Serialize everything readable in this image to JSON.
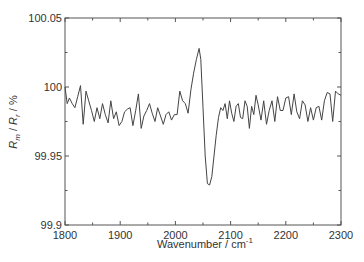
{
  "chart_data": {
    "type": "line",
    "title": "",
    "xlabel": "Wavenumber / cm-1",
    "xlabel_main": "Wavenumber / cm",
    "xlabel_sup": "-1",
    "ylabel": "R_m / R_r / %",
    "ylabel_parts": {
      "r1": "R",
      "sub1": "m",
      "sep1": " / ",
      "r2": "R",
      "sub2": "r",
      "sep2": " / %"
    },
    "xlim": [
      1800,
      2300
    ],
    "ylim": [
      99.9,
      100.05
    ],
    "x_ticks": [
      1800,
      1900,
      2000,
      2100,
      2200,
      2300
    ],
    "x_tick_labels": [
      "1800",
      "1900",
      "2000",
      "2100",
      "2200",
      "2300"
    ],
    "y_ticks": [
      99.9,
      99.95,
      100,
      100.05
    ],
    "y_tick_labels": [
      "99.9",
      "99.95",
      "100",
      "100.05"
    ],
    "grid": false,
    "legend": null,
    "series": [
      {
        "name": "R_m / R_r",
        "color": "#444444",
        "x": [
          1800,
          1804,
          1808,
          1813,
          1818,
          1823,
          1828,
          1833,
          1838,
          1843,
          1848,
          1853,
          1858,
          1863,
          1868,
          1873,
          1878,
          1883,
          1888,
          1893,
          1898,
          1903,
          1908,
          1913,
          1918,
          1923,
          1928,
          1933,
          1938,
          1943,
          1948,
          1953,
          1958,
          1963,
          1968,
          1973,
          1978,
          1983,
          1988,
          1993,
          1998,
          2003,
          2008,
          2013,
          2018,
          2023,
          2028,
          2033,
          2038,
          2043,
          2046,
          2050,
          2054,
          2058,
          2062,
          2066,
          2070,
          2074,
          2078,
          2082,
          2086,
          2090,
          2094,
          2098,
          2102,
          2106,
          2110,
          2114,
          2118,
          2122,
          2126,
          2130,
          2134,
          2138,
          2142,
          2146,
          2150,
          2155,
          2160,
          2165,
          2170,
          2175,
          2180,
          2185,
          2190,
          2195,
          2200,
          2205,
          2210,
          2215,
          2220,
          2225,
          2230,
          2235,
          2240,
          2245,
          2250,
          2255,
          2260,
          2265,
          2270,
          2275,
          2280,
          2285,
          2290,
          2295,
          2300
        ],
        "y": [
          100.0,
          99.988,
          99.992,
          99.988,
          99.985,
          99.993,
          100.001,
          99.973,
          99.997,
          99.99,
          99.983,
          99.975,
          99.985,
          99.977,
          99.988,
          99.98,
          99.974,
          99.99,
          99.977,
          99.982,
          99.972,
          99.975,
          99.982,
          99.984,
          99.985,
          99.972,
          99.983,
          99.995,
          99.97,
          99.979,
          99.983,
          99.988,
          99.981,
          99.975,
          99.985,
          99.979,
          99.973,
          99.98,
          99.982,
          99.976,
          99.98,
          99.98,
          99.997,
          99.99,
          99.988,
          99.981,
          99.998,
          100.01,
          100.02,
          100.028,
          100.02,
          99.985,
          99.95,
          99.93,
          99.929,
          99.935,
          99.95,
          99.965,
          99.978,
          99.985,
          99.983,
          99.988,
          99.977,
          99.99,
          99.981,
          99.975,
          99.986,
          99.988,
          99.978,
          99.977,
          99.99,
          99.986,
          99.97,
          99.986,
          99.98,
          99.994,
          99.987,
          99.976,
          99.99,
          99.973,
          99.983,
          99.99,
          99.975,
          99.993,
          99.983,
          99.983,
          99.992,
          99.993,
          99.98,
          99.995,
          99.982,
          99.977,
          99.99,
          99.987,
          99.975,
          99.985,
          99.976,
          99.985,
          99.986,
          99.976,
          99.99,
          99.996,
          99.995,
          99.975,
          99.997,
          99.995,
          99.994
        ]
      }
    ],
    "annotations": []
  }
}
